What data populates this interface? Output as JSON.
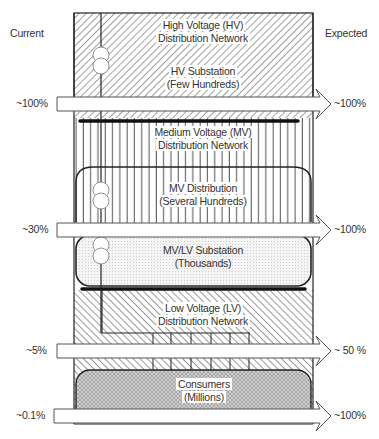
{
  "headers": {
    "current": "Current",
    "expected": "Expected"
  },
  "tiers": [
    {
      "name": "High Voltage (HV) Distribution Network",
      "line1": "High Voltage (HV)",
      "line2": "Distribution Network",
      "pattern": "diagonal-hatch-forward"
    },
    {
      "name": "HV Substation",
      "line1": "HV Substation",
      "line2": "(Few Hundreds)",
      "pattern": "diagonal-hatch-forward"
    },
    {
      "name": "Medium Voltage (MV) Distribution Network",
      "line1": "Medium Voltage (MV)",
      "line2": "Distribution Network",
      "pattern": "vertical-lines"
    },
    {
      "name": "MV Distribution",
      "line1": "MV Distribution",
      "line2": "(Several Hundreds)",
      "pattern": "vertical-lines"
    },
    {
      "name": "MV/LV Substation",
      "line1": "MV/LV Substation",
      "line2": "(Thousands)",
      "pattern": "dots"
    },
    {
      "name": "Low Voltage (LV) Distribution Network",
      "line1": "Low Voltage (LV)",
      "line2": "Distribution Network",
      "pattern": "diagonal-hatch-backward"
    },
    {
      "name": "Consumers",
      "line1": "Consumers",
      "line2": "(Millions)",
      "pattern": "crosshatch"
    }
  ],
  "arrows": [
    {
      "current": "~100%",
      "expected": "~100%"
    },
    {
      "current": "~30%",
      "expected": "~100%"
    },
    {
      "current": "~5%",
      "expected": "~ 50 %"
    },
    {
      "current": "~0.1%",
      "expected": "~100%"
    }
  ],
  "colors": {
    "line": "#222222",
    "hatch": "#555555",
    "dots_fill": "#f2f2f2",
    "crosshatch_fill": "#cfcfcf",
    "background": "#ffffff"
  }
}
